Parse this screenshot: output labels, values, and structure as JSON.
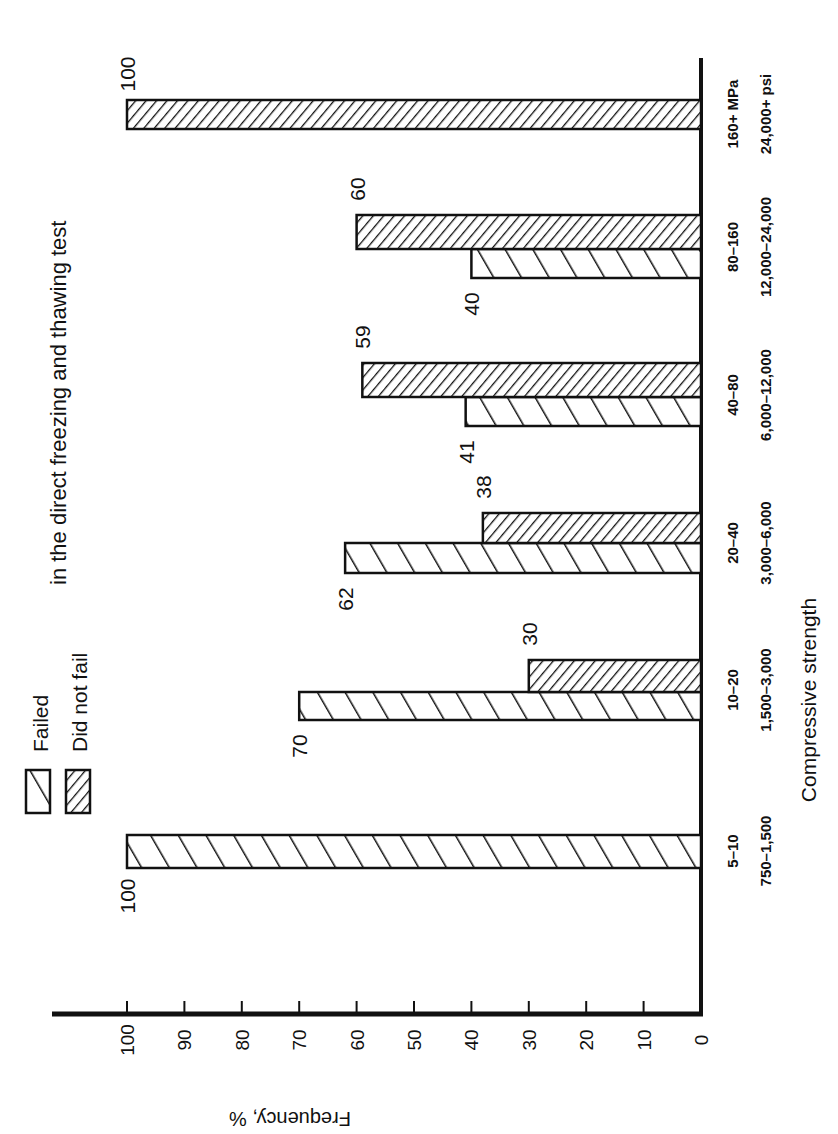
{
  "chart_data": {
    "type": "bar",
    "orientation": "rotated-90-clockwise (page printed sideways)",
    "title": "in the direct freezing and thawing test",
    "xlabel": "Compressive strength",
    "ylabel": "Frequency, %",
    "ylim": [
      0,
      100
    ],
    "yticks": [
      0,
      10,
      20,
      30,
      40,
      50,
      60,
      70,
      80,
      90,
      100
    ],
    "grid": false,
    "legend_position": "top-left (rotated view)",
    "categories": [
      "5–10",
      "10–20",
      "20–40",
      "40–80",
      "80–160",
      "160+"
    ],
    "category_labels_mpa": [
      "5–10",
      "10–20",
      "20–40",
      "40–80",
      "80–160",
      "160+ MPa"
    ],
    "category_labels_psi": [
      "750–1,500",
      "1,500–3,000",
      "3,000–6,000",
      "6,000–12,000",
      "12,000–24,000",
      "24,000+ psi"
    ],
    "series": [
      {
        "name": "Failed",
        "pattern": "wide-diagonal-hatch",
        "values": [
          100,
          70,
          62,
          41,
          40,
          null
        ]
      },
      {
        "name": "Did not fail",
        "pattern": "dense-diagonal-hatch",
        "values": [
          null,
          30,
          38,
          59,
          60,
          100
        ]
      }
    ]
  },
  "legend": {
    "items": [
      {
        "label": "Failed",
        "pattern": "wide-diagonal-hatch"
      },
      {
        "label": "Did not fail",
        "pattern": "dense-diagonal-hatch"
      }
    ]
  },
  "colors": {
    "ink": "#111111",
    "background": "#ffffff"
  }
}
